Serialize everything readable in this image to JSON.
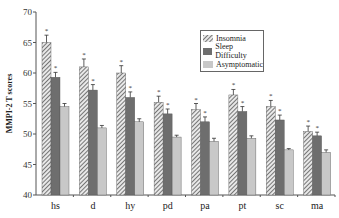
{
  "chart_data": {
    "type": "bar",
    "title": "",
    "xlabel": "",
    "ylabel": "MMPI-2 T scores",
    "ylim": [
      40,
      70
    ],
    "yticks": [
      40,
      45,
      50,
      55,
      60,
      65,
      70
    ],
    "categories": [
      "hs",
      "d",
      "hy",
      "pd",
      "pa",
      "pt",
      "sc",
      "ma"
    ],
    "series": [
      {
        "name": "Insomnia",
        "pattern": "hatched",
        "color": "#bdbdbd",
        "values": [
          65.0,
          61.0,
          60.0,
          55.2,
          54.0,
          56.4,
          54.5,
          50.4
        ],
        "errors": [
          1.2,
          1.3,
          1.2,
          1.0,
          1.0,
          0.9,
          1.0,
          0.9
        ]
      },
      {
        "name": "Sleep Difficulty",
        "pattern": "solid",
        "color": "#6e6e6e",
        "values": [
          59.3,
          57.2,
          56.0,
          53.3,
          52.0,
          53.7,
          52.3,
          49.7
        ],
        "errors": [
          0.8,
          0.9,
          0.9,
          0.8,
          0.8,
          0.8,
          0.8,
          0.6
        ]
      },
      {
        "name": "Asymptomatic",
        "pattern": "solid",
        "color": "#c8c8c8",
        "values": [
          54.5,
          51.0,
          52.0,
          49.5,
          48.8,
          49.3,
          47.4,
          47.0
        ],
        "errors": [
          0.5,
          0.4,
          0.5,
          0.3,
          0.5,
          0.4,
          0.2,
          0.4
        ]
      }
    ],
    "annotations": [
      {
        "text": "*",
        "meaning": "significance marker above Insomnia and Sleep Difficulty bars"
      }
    ],
    "grid": false,
    "legend_position": "upper right inside"
  },
  "legend": {
    "items": [
      "Insomnia",
      "Sleep Difficulty",
      "Asymptomatic"
    ]
  }
}
